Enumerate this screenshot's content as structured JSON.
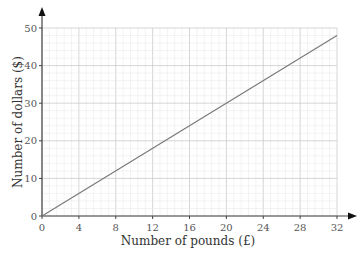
{
  "chart_data": {
    "type": "line",
    "title": "",
    "xlabel": "Number of pounds (£)",
    "ylabel": "Number of dollars ($)",
    "xlim": [
      0,
      32
    ],
    "ylim": [
      0,
      50
    ],
    "x_ticks": [
      0,
      4,
      8,
      12,
      16,
      20,
      24,
      28,
      32
    ],
    "y_ticks": [
      0,
      10,
      20,
      30,
      40,
      50
    ],
    "grid": true,
    "series": [
      {
        "name": "conversion",
        "x": [
          0,
          32
        ],
        "y": [
          0,
          48
        ],
        "color": "#777777"
      }
    ]
  },
  "colors": {
    "axis": "#444444",
    "grid_minor": "#e6e6e6",
    "grid_major": "#cccccc",
    "line": "#777777"
  }
}
